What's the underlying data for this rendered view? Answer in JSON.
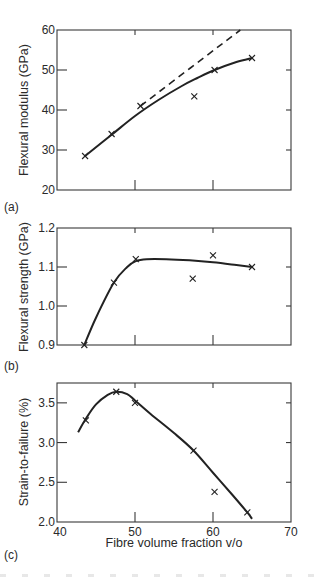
{
  "figure": {
    "colors": {
      "ink": "#222222",
      "frame": "#3a3a3a",
      "background": "#ffffff"
    },
    "marker": "x-cross"
  },
  "chart_data": [
    {
      "panel": "(a)",
      "type": "scatter",
      "title": "",
      "xlabel": "",
      "ylabel": "Flexural modulus (GPa)",
      "xlim": [
        40,
        70
      ],
      "ylim": [
        20,
        60
      ],
      "x_ticks": [
        40,
        50,
        60,
        70
      ],
      "x_tick_labels_shown": false,
      "y_ticks": [
        20,
        30,
        40,
        50,
        60
      ],
      "y_tick_labels": [
        "20",
        "30",
        "40",
        "50",
        "60"
      ],
      "grid": false,
      "legend": null,
      "series": [
        {
          "name": "measured",
          "style": "markers",
          "marker": "x",
          "x": [
            43.6,
            47.0,
            50.7,
            57.6,
            60.2,
            65.0
          ],
          "y": [
            28.5,
            34.0,
            41.0,
            43.4,
            50.0,
            53.0
          ]
        },
        {
          "name": "fitted curve",
          "style": "solid line",
          "x": [
            43.6,
            47.0,
            50.0,
            53.0,
            56.0,
            58.0,
            60.2,
            63.0,
            65.0
          ],
          "y": [
            28.5,
            33.8,
            38.5,
            42.5,
            46.0,
            48.0,
            50.0,
            52.0,
            53.0
          ]
        },
        {
          "name": "rule of mixtures (linear)",
          "style": "dashed line",
          "x": [
            50.7,
            63.5
          ],
          "y": [
            41.0,
            60.0
          ]
        }
      ]
    },
    {
      "panel": "(b)",
      "type": "scatter",
      "title": "",
      "xlabel": "",
      "ylabel": "Flexural strength (GPa)",
      "xlim": [
        40,
        70
      ],
      "ylim": [
        0.9,
        1.2
      ],
      "x_ticks": [
        40,
        50,
        60,
        70
      ],
      "x_tick_labels_shown": false,
      "y_ticks": [
        0.9,
        1.0,
        1.1,
        1.2
      ],
      "y_tick_labels": [
        "0.9",
        "1.0",
        "1.1",
        "1.2"
      ],
      "grid": false,
      "legend": null,
      "series": [
        {
          "name": "measured",
          "style": "markers",
          "marker": "x",
          "x": [
            43.5,
            47.3,
            50.1,
            57.4,
            60.0,
            65.0
          ],
          "y": [
            0.9,
            1.06,
            1.12,
            1.07,
            1.13,
            1.1
          ]
        },
        {
          "name": "fitted curve",
          "style": "solid line",
          "x": [
            43.5,
            45.0,
            47.3,
            49.0,
            50.1,
            51.5,
            54.0,
            57.0,
            60.0,
            63.0,
            65.0
          ],
          "y": [
            0.9,
            0.97,
            1.06,
            1.1,
            1.115,
            1.12,
            1.12,
            1.117,
            1.112,
            1.105,
            1.1
          ]
        }
      ]
    },
    {
      "panel": "(c)",
      "type": "scatter",
      "title": "",
      "xlabel": "Fibre volume fraction v/o",
      "ylabel": "Strain-to-failure (%)",
      "xlim": [
        40,
        70
      ],
      "ylim": [
        2.0,
        3.75
      ],
      "x_ticks": [
        40,
        50,
        60,
        70
      ],
      "x_tick_labels": [
        "40",
        "50",
        "60",
        "70"
      ],
      "x_tick_labels_shown": true,
      "y_ticks": [
        2.0,
        2.5,
        3.0,
        3.5
      ],
      "y_tick_labels": [
        "2.0",
        "2.5",
        "3.0",
        "3.5"
      ],
      "grid": false,
      "legend": null,
      "series": [
        {
          "name": "measured",
          "style": "markers",
          "marker": "x",
          "x": [
            43.7,
            47.6,
            50.0,
            57.5,
            60.2,
            64.4
          ],
          "y": [
            3.28,
            3.64,
            3.5,
            2.9,
            2.38,
            2.12
          ]
        },
        {
          "name": "fitted curve",
          "style": "solid line",
          "x": [
            42.7,
            43.7,
            45.0,
            46.5,
            47.6,
            49.0,
            50.0,
            52.0,
            55.0,
            57.5,
            60.0,
            62.5,
            64.4,
            65.0
          ],
          "y": [
            3.13,
            3.3,
            3.48,
            3.6,
            3.64,
            3.61,
            3.53,
            3.36,
            3.12,
            2.9,
            2.62,
            2.34,
            2.12,
            2.04
          ]
        }
      ]
    }
  ],
  "labels": {
    "panel_a": "(a)",
    "panel_b": "(b)",
    "panel_c": "(c)",
    "ylabel_a": "Flexural modulus (GPa)",
    "ylabel_b": "Flexural strength (GPa)",
    "ylabel_c": "Strain-to-failure (%)",
    "xlabel_c": "Fibre volume fraction v/o"
  }
}
